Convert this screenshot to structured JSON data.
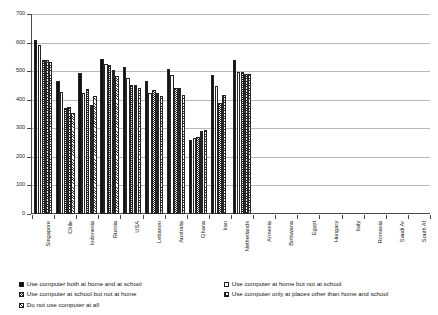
{
  "chart_data": {
    "type": "bar",
    "title": "",
    "xlabel": "",
    "ylabel": "",
    "ylim": [
      0,
      700
    ],
    "ytick_step": 100,
    "yticks": [
      0,
      100,
      200,
      300,
      400,
      500,
      600,
      700
    ],
    "grid": true,
    "legend_position": "bottom",
    "categories": [
      "Singapore",
      "Chile",
      "Indonesia",
      "Russia",
      "USA",
      "Lebanon",
      "Australia",
      "Ghana",
      "Iran",
      "Netherlands",
      "Armenia",
      "Botswana",
      "Egypt",
      "Hungary",
      "Italy",
      "Romania",
      "Saudi Ar",
      "South Af"
    ],
    "series": [
      {
        "name": "Use computer both at home and at school",
        "swatch": "solid-black",
        "values": [
          610,
          465,
          492,
          543,
          515,
          464,
          507,
          258,
          485,
          540,
          null,
          null,
          null,
          null,
          null,
          null,
          null,
          null
        ]
      },
      {
        "name": "Use computer at home but not at school",
        "swatch": "white-outline",
        "values": [
          590,
          428,
          423,
          525,
          477,
          425,
          487,
          265,
          448,
          498,
          null,
          null,
          null,
          null,
          null,
          null,
          null,
          null
        ]
      },
      {
        "name": "Use computer at school but not at home",
        "swatch": "dotted",
        "values": [
          540,
          370,
          437,
          520,
          452,
          435,
          440,
          270,
          390,
          497,
          null,
          null,
          null,
          null,
          null,
          null,
          null,
          null
        ]
      },
      {
        "name": "Use computer only at places other than home and school",
        "swatch": "dense-grid",
        "values": [
          540,
          373,
          380,
          505,
          450,
          424,
          440,
          290,
          418,
          490,
          null,
          null,
          null,
          null,
          null,
          null,
          null,
          null
        ]
      },
      {
        "name": "Do not use computer at all",
        "swatch": "hatched",
        "values": [
          532,
          353,
          412,
          482,
          440,
          412,
          418,
          293,
          null,
          490,
          null,
          null,
          null,
          null,
          null,
          null,
          null,
          null
        ]
      }
    ]
  },
  "legend": {
    "left_column": [
      "Use computer both at home and at school",
      "Use computer at school but not at home",
      "Do not use computer at all"
    ],
    "right_column": [
      "Use computer at home but not at school",
      "Use computer only at places other than home and school"
    ]
  }
}
